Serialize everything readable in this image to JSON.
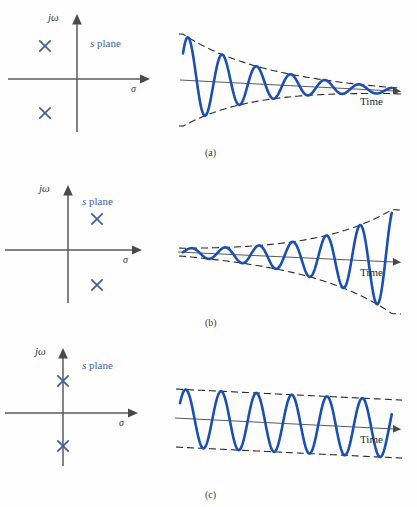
{
  "figure": {
    "background_color": "#fefefe",
    "axis_color": "#5a5a5a",
    "pole_color": "#3f5fa8",
    "wave_color": "#1a4fb4",
    "envelope_color": "#2b2b2b",
    "label_color": "#3a3a3a"
  },
  "labels": {
    "jomega": "jω",
    "sigma": "σ",
    "s_plane": "s plane",
    "s_plane_italic": "s",
    "s_plane_rest": " plane",
    "time": "Time",
    "pole_marker": "×"
  },
  "panels": [
    {
      "id": "a",
      "caption": "(a)",
      "caption_x": 205,
      "caption_y": 148,
      "splane": {
        "origin_x": 77,
        "origin_y": 79,
        "x_axis": {
          "x1": 8,
          "y1": 79,
          "x2": 148,
          "y2": 79
        },
        "y_axis": {
          "x1": 77,
          "y1": 132,
          "x2": 77,
          "y2": 16
        },
        "jw_label_x": 48,
        "jw_label_y": 12,
        "sigma_label_x": 131,
        "sigma_label_y": 84,
        "s_plane_label_x": 90,
        "s_plane_label_y": 38,
        "poles": [
          {
            "x": 45,
            "y": 46,
            "label": "pole-upper-left-half-plane"
          },
          {
            "x": 45,
            "y": 113,
            "label": "pole-lower-left-half-plane"
          }
        ],
        "pole_region": "left half plane"
      },
      "response": {
        "type": "damped-sinusoid",
        "description": "Exponentially decaying oscillation",
        "baseline": {
          "x1": 180,
          "y1": 80,
          "x2": 400,
          "y2": 91
        },
        "arrow_tip_x": 404,
        "arrow_tip_y": 91,
        "time_label_x": 360,
        "time_label_y": 96,
        "x_start": 183,
        "x_end": 392,
        "amp_start": 46,
        "amp_end": 3,
        "decay_sign": -1,
        "cycles": 6.1,
        "phase": 0.62
      }
    },
    {
      "id": "b",
      "caption": "(b)",
      "caption_x": 205,
      "caption_y": 318,
      "splane": {
        "origin_x": 68,
        "origin_y": 250,
        "x_axis": {
          "x1": 5,
          "y1": 250,
          "x2": 140,
          "y2": 250
        },
        "y_axis": {
          "x1": 68,
          "y1": 303,
          "x2": 68,
          "y2": 187
        },
        "jw_label_x": 39,
        "jw_label_y": 183,
        "sigma_label_x": 123,
        "sigma_label_y": 255,
        "s_plane_label_x": 82,
        "s_plane_label_y": 196,
        "poles": [
          {
            "x": 97,
            "y": 219,
            "label": "pole-upper-right-half-plane"
          },
          {
            "x": 97,
            "y": 285,
            "label": "pole-lower-right-half-plane"
          }
        ],
        "pole_region": "right half plane"
      },
      "response": {
        "type": "growing-sinusoid",
        "description": "Exponentially growing oscillation",
        "baseline": {
          "x1": 178,
          "y1": 252,
          "x2": 400,
          "y2": 262
        },
        "arrow_tip_x": 404,
        "arrow_tip_y": 262,
        "time_label_x": 360,
        "time_label_y": 267,
        "x_start": 183,
        "x_end": 392,
        "amp_start": 4,
        "amp_end": 52,
        "decay_sign": 1,
        "cycles": 6.2,
        "phase": 0.0
      }
    },
    {
      "id": "c",
      "caption": "(c)",
      "caption_x": 205,
      "caption_y": 490,
      "splane": {
        "origin_x": 63,
        "origin_y": 413,
        "x_axis": {
          "x1": 5,
          "y1": 413,
          "x2": 136,
          "y2": 413
        },
        "y_axis": {
          "x1": 63,
          "y1": 466,
          "x2": 63,
          "y2": 350
        },
        "jw_label_x": 35,
        "jw_label_y": 346,
        "sigma_label_x": 119,
        "sigma_label_y": 418,
        "s_plane_label_x": 82,
        "s_plane_label_y": 360,
        "poles": [
          {
            "x": 63,
            "y": 381,
            "label": "pole-upper-imaginary-axis"
          },
          {
            "x": 63,
            "y": 446,
            "label": "pole-lower-imaginary-axis"
          }
        ],
        "pole_region": "imaginary axis"
      },
      "response": {
        "type": "constant-sinusoid",
        "description": "Constant amplitude oscillation",
        "baseline": {
          "x1": 175,
          "y1": 418,
          "x2": 400,
          "y2": 429
        },
        "arrow_tip_x": 404,
        "arrow_tip_y": 429,
        "time_label_x": 360,
        "time_label_y": 434,
        "x_start": 180,
        "x_end": 392,
        "amp_start": 29,
        "amp_end": 29,
        "decay_sign": 0,
        "cycles": 6.0,
        "phase": 0.55
      }
    }
  ]
}
